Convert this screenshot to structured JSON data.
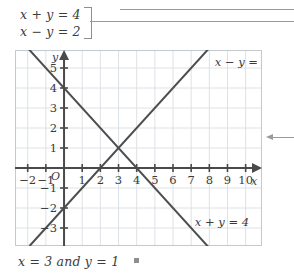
{
  "system": {
    "equation_1": "x + y = 4",
    "equation_2": "x − y = 2",
    "bracket": "]"
  },
  "answer": {
    "text": "x = 3 and y = 1"
  },
  "chart_data": {
    "type": "line",
    "title": "",
    "xlabel": "x",
    "ylabel": "y",
    "xlim": [
      -2.7,
      10.9
    ],
    "ylim": [
      -3.9,
      5.9
    ],
    "grid": true,
    "origin_label": "O",
    "xticks": [
      -2,
      -1,
      1,
      2,
      3,
      4,
      5,
      6,
      7,
      8,
      9,
      10
    ],
    "xticklabels": [
      "−2",
      "−1",
      "1",
      "2",
      "3",
      "4",
      "5",
      "6",
      "7",
      "8",
      "9",
      "10"
    ],
    "yticks": [
      -3,
      -2,
      -1,
      1,
      2,
      3,
      4,
      5
    ],
    "yticklabels": [
      "−3",
      "−2",
      "−1",
      "1",
      "2",
      "3",
      "4",
      "5"
    ],
    "series": [
      {
        "name": "x + y = 4",
        "label": "x + y = 4",
        "slope": -1,
        "intercept": 4,
        "points": [
          [
            -2.4,
            6.4
          ],
          [
            8.0,
            -4.0
          ]
        ],
        "x_intercept": 4,
        "y_intercept": 4
      },
      {
        "name": "x − y = 2",
        "label": "x − y = 2",
        "slope": 1,
        "intercept": -2,
        "points": [
          [
            -1.9,
            -3.9
          ],
          [
            8.0,
            6.0
          ]
        ],
        "x_intercept": 2,
        "y_intercept": -2
      }
    ],
    "intersection": {
      "x": 3,
      "y": 1
    },
    "annotations": [
      {
        "text": "x − y = 2",
        "x": 8.3,
        "y": 5.1
      },
      {
        "text": "x + y = 4",
        "x": 7.2,
        "y": -2.9
      }
    ]
  },
  "colors": {
    "grid": "#d9dfe3",
    "frame": "#c3cbd1",
    "axis": "#4a4a4a",
    "curve": "#4d4d4d",
    "leader": "#9a9a9a",
    "text": "#3a3a3a",
    "background": "#ffffff"
  }
}
